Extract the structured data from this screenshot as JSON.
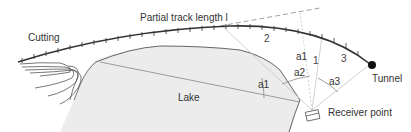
{
  "diagram": {
    "type": "noise-propagation-geometry",
    "labels": {
      "track": "Partial track length l",
      "cutting": "Cutting",
      "lake": "Lake",
      "tunnel": "Tunnel",
      "receiver": "Receiver point",
      "segment_1": "1",
      "segment_2": "2",
      "segment_3": "3",
      "angle_a1_upper": "a1",
      "angle_a1_lake": "a1",
      "angle_a2": "a2",
      "angle_a3": "a3"
    },
    "colors": {
      "track": "#333333",
      "lake_fill": "#ececec",
      "lake_edge": "#666666",
      "contours": "#555555",
      "rays": "#bbbbbb",
      "dashed_tangent": "#888888",
      "tunnel": "#111111",
      "text": "#333333"
    }
  }
}
